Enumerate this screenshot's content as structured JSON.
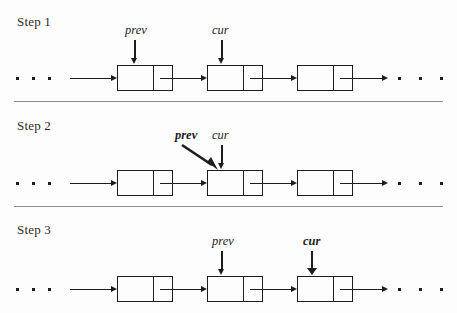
{
  "figure": {
    "type": "linked-list-pointer-diagram",
    "background_color": "#fdfdfd",
    "ink_color": "#1d1d1d",
    "separator_color": "#8d8d8d",
    "ellipsis_glyph": "dot",
    "steps": [
      {
        "label": "Step 1",
        "pointers": [
          {
            "name": "prev",
            "style": "italic",
            "arrow": "vertical",
            "target_node": 1
          },
          {
            "name": "cur",
            "style": "italic",
            "arrow": "vertical",
            "target_node": 2
          }
        ],
        "nodes": 3,
        "leading_ellipsis": true,
        "trailing_ellipsis": true
      },
      {
        "label": "Step 2",
        "pointers": [
          {
            "name": "prev",
            "style": "bold-italic",
            "arrow": "diagonal",
            "target_node": 2
          },
          {
            "name": "cur",
            "style": "italic",
            "arrow": "vertical",
            "target_node": 2
          }
        ],
        "nodes": 3,
        "leading_ellipsis": true,
        "trailing_ellipsis": true
      },
      {
        "label": "Step 3",
        "pointers": [
          {
            "name": "prev",
            "style": "italic",
            "arrow": "vertical",
            "target_node": 2
          },
          {
            "name": "cur",
            "style": "bold-italic",
            "arrow": "vertical",
            "target_node": 3
          }
        ],
        "nodes": 3,
        "leading_ellipsis": true,
        "trailing_ellipsis": true
      }
    ]
  },
  "step1": {
    "label": "Step 1",
    "prev_label": "prev",
    "cur_label": "cur"
  },
  "step2": {
    "label": "Step 2",
    "prev_label": "prev",
    "cur_label": "cur"
  },
  "step3": {
    "label": "Step 3",
    "prev_label": "prev",
    "cur_label": "cur"
  }
}
